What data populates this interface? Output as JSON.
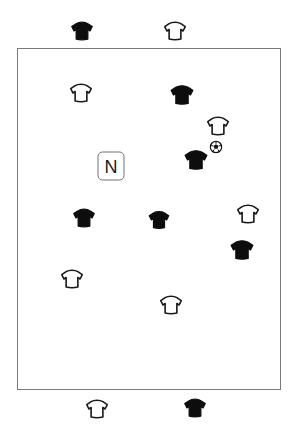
{
  "board": {
    "width": 300,
    "height": 445,
    "background": "#ffffff",
    "title": "Soccer tactics board"
  },
  "field": {
    "label": "playing-field",
    "x": 17,
    "y": 48,
    "width": 264,
    "height": 342,
    "border_color": "#7a7a7a",
    "border_width": 1.6,
    "fill": "#ffffff"
  },
  "legend": {
    "dark_team_color": "#0d0d0d",
    "light_team_color": "#ffffff",
    "light_team_outline": "#1a1a1a"
  },
  "marker": {
    "label": "N",
    "x": 111,
    "y": 166,
    "width": 27,
    "height": 29,
    "radius": 5,
    "border_color": "#6f6f6f",
    "text_color": "#1a1a1a",
    "font_size": 18
  },
  "ball": {
    "label": "soccer-ball",
    "x": 216,
    "y": 147,
    "size": 13,
    "outline_color": "#111111",
    "fill": "#ffffff",
    "panel_color": "#111111"
  },
  "players": [
    {
      "id": "p1",
      "team": "dark",
      "x": 82,
      "y": 31,
      "location": "above-field",
      "scale": 1.0
    },
    {
      "id": "p2",
      "team": "light",
      "x": 175,
      "y": 31,
      "location": "above-field",
      "scale": 1.0
    },
    {
      "id": "p3",
      "team": "light",
      "x": 81,
      "y": 93,
      "location": "on-field",
      "scale": 1.0
    },
    {
      "id": "p4",
      "team": "dark",
      "x": 182,
      "y": 95,
      "location": "on-field",
      "scale": 1.05
    },
    {
      "id": "p5",
      "team": "light",
      "x": 218,
      "y": 126,
      "location": "on-field",
      "scale": 1.0
    },
    {
      "id": "p6",
      "team": "dark",
      "x": 196,
      "y": 160,
      "location": "on-field",
      "scale": 1.05
    },
    {
      "id": "p7",
      "team": "dark",
      "x": 84,
      "y": 218,
      "location": "on-field",
      "scale": 1.0
    },
    {
      "id": "p8",
      "team": "dark",
      "x": 159,
      "y": 220,
      "location": "on-field",
      "scale": 0.95
    },
    {
      "id": "p9",
      "team": "light",
      "x": 248,
      "y": 214,
      "location": "on-field",
      "scale": 1.0
    },
    {
      "id": "p10",
      "team": "dark",
      "x": 242,
      "y": 250,
      "location": "on-field",
      "scale": 1.05
    },
    {
      "id": "p11",
      "team": "light",
      "x": 72,
      "y": 279,
      "location": "on-field",
      "scale": 1.0
    },
    {
      "id": "p12",
      "team": "light",
      "x": 171,
      "y": 305,
      "location": "on-field",
      "scale": 1.0
    },
    {
      "id": "p13",
      "team": "light",
      "x": 97,
      "y": 409,
      "location": "below-field",
      "scale": 1.0
    },
    {
      "id": "p14",
      "team": "dark",
      "x": 195,
      "y": 408,
      "location": "below-field",
      "scale": 1.0
    }
  ]
}
